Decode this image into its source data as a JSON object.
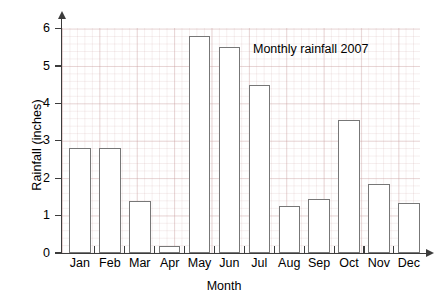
{
  "chart_data": {
    "type": "bar",
    "title": "Monthly rainfall 2007",
    "xlabel": "Month",
    "ylabel": "Rainfall (inches)",
    "categories": [
      "Jan",
      "Feb",
      "Mar",
      "Apr",
      "May",
      "Jun",
      "Jul",
      "Aug",
      "Sep",
      "Oct",
      "Nov",
      "Dec"
    ],
    "values": [
      2.8,
      2.8,
      1.4,
      0.2,
      5.8,
      5.5,
      4.5,
      1.25,
      1.45,
      3.55,
      1.85,
      1.35
    ],
    "ylim": [
      0,
      6
    ],
    "yticks": [
      0,
      1,
      2,
      3,
      4,
      5,
      6
    ],
    "ytick_labels": [
      "0",
      "1",
      "2",
      "3",
      "4",
      "5",
      "6"
    ],
    "grid": true,
    "legend": "none",
    "bar_fill_color": "#ffffff",
    "bar_edge_color": "#777777",
    "axis_color": "#3c3c3c",
    "grid_color": "#c49696"
  }
}
